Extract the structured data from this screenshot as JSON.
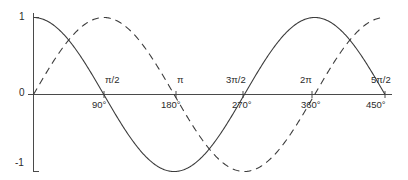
{
  "figure": {
    "background_color": "#ffffff",
    "stroke_color": "#3c3c3c",
    "axis_color": "#4a4a4a",
    "width": 408,
    "height": 180
  },
  "chart_data": {
    "type": "line",
    "title": "",
    "subtitle": "",
    "xlabel": "",
    "ylabel": "",
    "grid": false,
    "legend": "none",
    "xlim": [
      0,
      7.853981634
    ],
    "ylim": [
      -1,
      1
    ],
    "x_unit": "radians",
    "x_tick_values": [
      0,
      1.570796327,
      3.141592654,
      4.71238898,
      6.283185307,
      7.853981634
    ],
    "x_tick_labels_radians": [
      "",
      "π/2",
      "π",
      "3π/2",
      "2π",
      "5π/2"
    ],
    "x_tick_labels_degrees": [
      "",
      "90°",
      "180°",
      "270°",
      "360°",
      "450°"
    ],
    "y_tick_values": [
      1,
      0,
      -1
    ],
    "y_tick_labels": [
      "1",
      "0",
      "-1"
    ],
    "series": [
      {
        "name": "cosine",
        "style": "solid",
        "formula": "y = cos(x)",
        "x": [
          0,
          0.3926990817,
          0.7853981634,
          1.178097245,
          1.570796327,
          1.963495408,
          2.35619449,
          2.748893572,
          3.141592654,
          3.534291735,
          3.926990817,
          4.319689899,
          4.71238898,
          5.105088062,
          5.497787144,
          5.890486225,
          6.283185307,
          6.675884389,
          7.06858347,
          7.461282552,
          7.853981634
        ],
        "y": [
          1,
          0.9238795325,
          0.7071067812,
          0.3826834324,
          0,
          -0.3826834324,
          -0.7071067812,
          -0.9238795325,
          -1,
          -0.9238795325,
          -0.7071067812,
          -0.3826834324,
          0,
          0.3826834324,
          0.7071067812,
          0.9238795325,
          1,
          0.9238795325,
          0.7071067812,
          0.3826834324,
          0
        ]
      },
      {
        "name": "sine",
        "style": "dashed",
        "formula": "y = sin(x)",
        "x": [
          0,
          0.3926990817,
          0.7853981634,
          1.178097245,
          1.570796327,
          1.963495408,
          2.35619449,
          2.748893572,
          3.141592654,
          3.534291735,
          3.926990817,
          4.319689899,
          4.71238898,
          5.105088062,
          5.497787144,
          5.890486225,
          6.283185307,
          6.675884389,
          7.06858347,
          7.461282552,
          7.853981634
        ],
        "y": [
          0,
          0.3826834324,
          0.7071067812,
          0.9238795325,
          1,
          0.9238795325,
          0.7071067812,
          0.3826834324,
          0,
          -0.3826834324,
          -0.7071067812,
          -0.9238795325,
          -1,
          -0.9238795325,
          -0.7071067812,
          -0.3826834324,
          0,
          0.3826834324,
          0.7071067812,
          0.9238795325,
          1
        ]
      }
    ],
    "annotations": []
  },
  "labels": {
    "y_top": "1",
    "y_zero": "0",
    "y_bottom": "-1",
    "rad": {
      "half_pi": "π/2",
      "pi": "π",
      "three_half_pi": "3π/2",
      "two_pi": "2π",
      "five_half_pi": "5π/2"
    },
    "deg": {
      "d90": "90°",
      "d180": "180°",
      "d270": "270°",
      "d360": "360°",
      "d450": "450°"
    }
  }
}
